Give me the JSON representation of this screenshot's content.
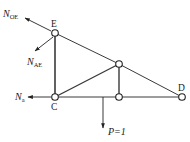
{
  "diagram": {
    "type": "truss-free-body",
    "nodes": [
      {
        "id": "E",
        "label": "E",
        "x": 55,
        "y": 33
      },
      {
        "id": "C",
        "label": "C",
        "x": 55,
        "y": 97
      },
      {
        "id": "F",
        "label": "",
        "x": 119,
        "y": 64
      },
      {
        "id": "G",
        "label": "",
        "x": 119,
        "y": 97
      },
      {
        "id": "D",
        "label": "D",
        "x": 182,
        "y": 97
      }
    ],
    "members": [
      [
        "E",
        "C"
      ],
      [
        "E",
        "F"
      ],
      [
        "F",
        "D"
      ],
      [
        "C",
        "F"
      ],
      [
        "C",
        "G"
      ],
      [
        "G",
        "D"
      ],
      [
        "F",
        "G"
      ]
    ],
    "forces": {
      "n_oe": {
        "main": "N",
        "sub": "OE"
      },
      "n_ae": {
        "main": "N",
        "sub": "AE"
      },
      "n_a": {
        "main": "N",
        "sub": "a"
      },
      "load": {
        "label": "P=1"
      }
    },
    "colors": {
      "line": "#333333",
      "node_fill": "#ffffff"
    }
  }
}
